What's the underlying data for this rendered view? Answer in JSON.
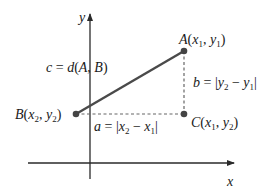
{
  "diagram": {
    "axes": {
      "x_label": "x",
      "y_label": "y"
    },
    "points": {
      "A": {
        "name": "A",
        "coords": "(x1, y1)",
        "x_var": "x",
        "x_sub": "1",
        "y_var": "y",
        "y_sub": "1"
      },
      "B": {
        "name": "B",
        "coords": "(x2, y2)",
        "x_var": "x",
        "x_sub": "2",
        "y_var": "y",
        "y_sub": "2"
      },
      "C": {
        "name": "C",
        "coords": "(x1, y2)",
        "x_var": "x",
        "x_sub": "1",
        "y_var": "y",
        "y_sub": "2"
      }
    },
    "segments": {
      "c": {
        "label": "c = d(A, B)",
        "lhs": "c",
        "eq": " = ",
        "fn": "d",
        "args": "(A, B)",
        "style": "solid"
      },
      "b": {
        "label": "b = |y2 − y1|",
        "lhs": "b",
        "eq": " = ",
        "style": "dashed"
      },
      "a": {
        "label": "a = |x2 − x1|",
        "lhs": "a",
        "eq": " = ",
        "style": "dashed"
      }
    },
    "colors": {
      "axis": "#2a2a2a",
      "segment": "#4a4a4a",
      "dashed": "#666666",
      "point": "#444444",
      "text": "#1a1a1a"
    }
  }
}
